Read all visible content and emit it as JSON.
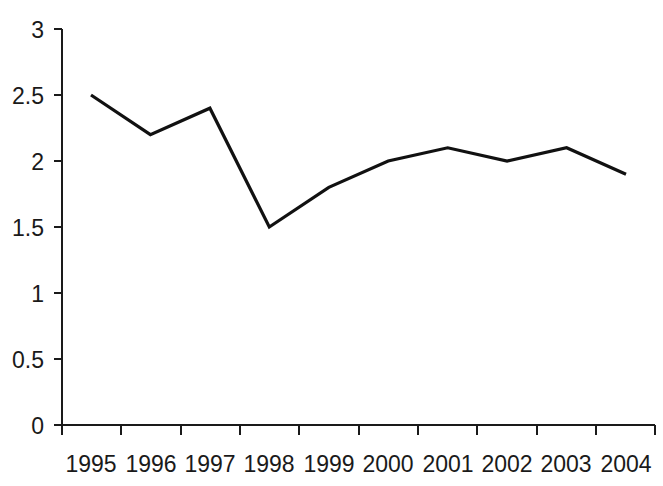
{
  "chart_data": {
    "type": "line",
    "title": "",
    "subtitle": "",
    "xlabel": "",
    "ylabel": "",
    "categories": [
      "1995",
      "1996",
      "1997",
      "1998",
      "1999",
      "2000",
      "2001",
      "2002",
      "2003",
      "2004"
    ],
    "values": [
      2.5,
      2.2,
      2.4,
      1.5,
      1.8,
      2.0,
      2.1,
      2.0,
      2.1,
      1.9
    ],
    "series": [
      {
        "name": "",
        "values": [
          2.5,
          2.2,
          2.4,
          1.5,
          1.8,
          2.0,
          2.1,
          2.0,
          2.1,
          1.9
        ],
        "color": "#111111"
      }
    ],
    "ylim": [
      0,
      3
    ],
    "yticks": [
      0,
      0.5,
      1,
      1.5,
      2,
      2.5,
      3
    ],
    "ytick_labels": [
      "0",
      "0.5",
      "1",
      "1.5",
      "2",
      "2.5",
      "3"
    ],
    "xtick_labels": [
      "1995",
      "1996",
      "1997",
      "1998",
      "1999",
      "2000",
      "2001",
      "2002",
      "2003",
      "2004"
    ],
    "grid": false,
    "legend": false,
    "legend_position": "none",
    "markers": false,
    "line_color": "#111111",
    "axis_color": "#1a1a1a",
    "background_color": "#ffffff",
    "annotations": []
  },
  "axes": {
    "y_axis_name": "y-axis",
    "x_axis_name": "x-axis"
  }
}
